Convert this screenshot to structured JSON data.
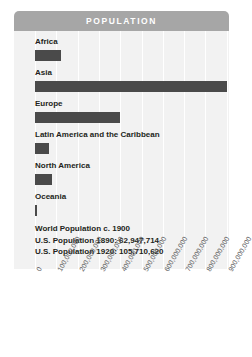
{
  "header": {
    "title": "POPULATION"
  },
  "annotation": {
    "lines": [
      "World Population c. 1900",
      "U.S. Population 1890: 62,947,714",
      "U.S. Population 1920: 105,710,620"
    ]
  },
  "colors": {
    "header_bg": "#a6a6a6",
    "plot_bg": "#f2f2f2",
    "bar": "#4a4a4a",
    "gridline": "#ffffff",
    "text": "#231f20",
    "tick_text": "#58595b"
  },
  "chart_data": {
    "type": "bar",
    "title": "POPULATION",
    "orientation": "horizontal",
    "xlabel": "",
    "ylabel": "",
    "xlim": [
      0,
      1000000000
    ],
    "grid": true,
    "legend": "none",
    "categories": [
      "Africa",
      "Asia",
      "Europe",
      "Latin America and the Caribbean",
      "North America",
      "Oceania"
    ],
    "values": [
      120000000,
      900000000,
      400000000,
      65000000,
      82000000,
      6000000
    ],
    "tick_labels": [
      "0",
      "100,000,000",
      "200,000,000",
      "300,000,000",
      "400,000,000",
      "500,000,000",
      "600,000,000",
      "700,000,000",
      "800,000,000",
      "900,000,000"
    ],
    "tick_values": [
      0,
      100000000,
      200000000,
      300000000,
      400000000,
      500000000,
      600000000,
      700000000,
      800000000,
      900000000
    ],
    "annotations": [
      "World Population c. 1900",
      "U.S. Population 1890: 62,947,714",
      "U.S. Population 1920: 105,710,620"
    ]
  }
}
